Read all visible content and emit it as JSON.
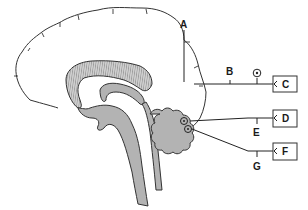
{
  "diagram": {
    "labels": {
      "A": "A",
      "B": "B",
      "C": "C",
      "D": "D",
      "E": "E",
      "F": "F",
      "G": "G"
    },
    "boxed_labels": [
      "C",
      "D",
      "F"
    ],
    "colors": {
      "outline": "#222222",
      "fill_gray": "#b3b3b3",
      "background": "#ffffff"
    }
  }
}
